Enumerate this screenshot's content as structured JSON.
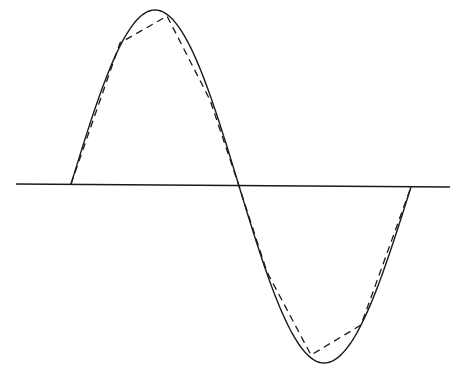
{
  "diagram": {
    "canvas": {
      "width": 459,
      "height": 373
    },
    "colors": {
      "background": "#ffffff",
      "stroke": "#1a1a1a"
    },
    "axis": {
      "x1": 16,
      "y1": 184,
      "x2": 450,
      "y2": 187,
      "stroke_width": 1.4
    },
    "sine_curve": {
      "style": "solid",
      "stroke_width": 1.4,
      "zero_crossings": [
        [
          71,
          184
        ],
        [
          239,
          186
        ],
        [
          411,
          187
        ]
      ],
      "peak": [
        155,
        10
      ],
      "trough": [
        324,
        363
      ]
    },
    "approximation": {
      "style": "dashed",
      "dash": "7 5",
      "stroke_width": 1.3,
      "points": [
        [
          71,
          184
        ],
        [
          120,
          43
        ],
        [
          167,
          16
        ],
        [
          210,
          100
        ],
        [
          239,
          186
        ],
        [
          267,
          272
        ],
        [
          311,
          355
        ],
        [
          361,
          325
        ],
        [
          411,
          187
        ]
      ]
    }
  }
}
